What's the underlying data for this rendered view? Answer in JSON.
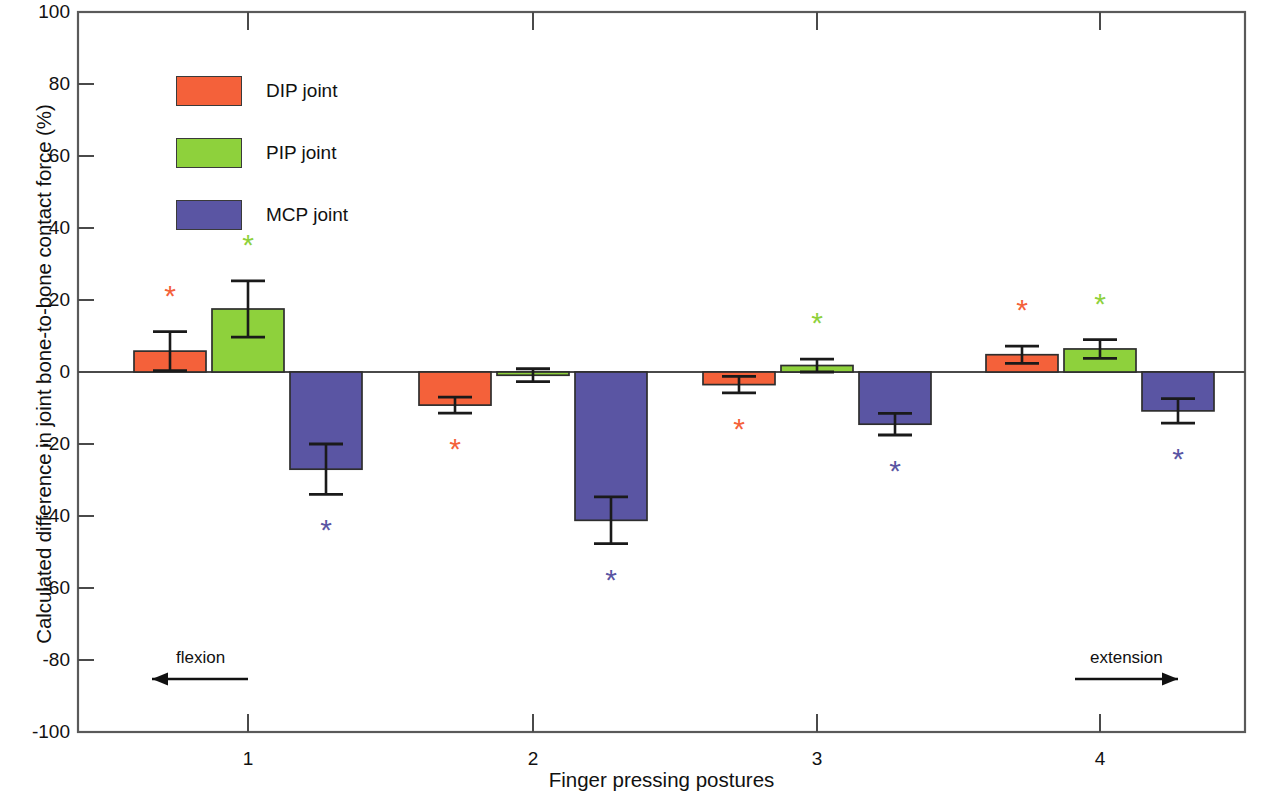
{
  "chart_data": {
    "type": "bar",
    "title": "",
    "xlabel": "Finger pressing postures",
    "ylabel": "Calculated difference in joint bone-to-bone contact force (%)",
    "categories": [
      "1",
      "2",
      "3",
      "4"
    ],
    "ylim": [
      -100,
      100
    ],
    "yticks": [
      100,
      80,
      60,
      40,
      20,
      0,
      -20,
      -40,
      -60,
      -80,
      -100
    ],
    "ytick_labels": [
      "100",
      "80",
      "60",
      "40",
      "20",
      "0",
      "-20",
      "-40",
      "-60",
      "-80",
      "-100"
    ],
    "grid": false,
    "legend_position": "upper-left-inside",
    "orientation": "vertical",
    "error_bars": "symmetric-sd",
    "significance_marker": "*",
    "series": [
      {
        "name": "DIP joint",
        "color": "#F4613A",
        "values": [
          5.8,
          -9.2,
          -3.5,
          4.8
        ],
        "errors": [
          5.4,
          2.2,
          2.3,
          2.4
        ],
        "significant": [
          true,
          true,
          true,
          true
        ]
      },
      {
        "name": "PIP joint",
        "color": "#8ED13C",
        "values": [
          17.5,
          -0.9,
          1.8,
          6.4
        ],
        "errors": [
          7.8,
          1.8,
          1.8,
          2.6
        ],
        "significant": [
          true,
          false,
          true,
          true
        ]
      },
      {
        "name": "MCP joint",
        "color": "#5A55A3",
        "values": [
          -27.0,
          -41.2,
          -14.5,
          -10.8
        ],
        "errors": [
          7.0,
          6.5,
          3.0,
          3.4
        ],
        "significant": [
          true,
          true,
          true,
          true
        ]
      }
    ],
    "annotations": [
      {
        "text": "flexion",
        "direction": "left"
      },
      {
        "text": "extension",
        "direction": "right"
      }
    ]
  },
  "legend": {
    "items": [
      {
        "label": "DIP joint",
        "color": "#F4613A"
      },
      {
        "label": "PIP joint",
        "color": "#8ED13C"
      },
      {
        "label": "MCP joint",
        "color": "#5A55A3"
      }
    ]
  },
  "annotations": {
    "flexion": "flexion",
    "extension": "extension"
  }
}
